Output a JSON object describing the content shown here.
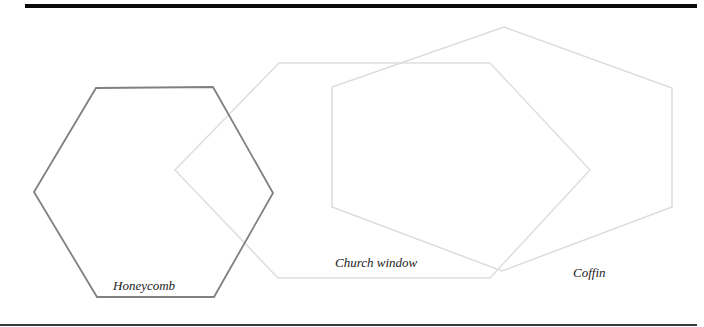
{
  "figure": {
    "rules": {
      "top": {
        "x1": 25,
        "x2": 697,
        "y": 6,
        "width": 4,
        "color": "#0a0a0a"
      },
      "bottom": {
        "x1": 0,
        "x2": 697,
        "y": 325,
        "width": 2,
        "color": "#3a3a3a"
      }
    },
    "shapes": [
      {
        "id": "honeycomb",
        "label": "Honeycomb",
        "stroke": "#808080",
        "stroke_width": 1.8,
        "points": "96,88 213,87 273,193 214,297 97,297 34,192",
        "label_pos": {
          "x": 113,
          "y": 279
        }
      },
      {
        "id": "church-window",
        "label": "Church window",
        "stroke": "#dedede",
        "stroke_width": 1.5,
        "points": "175,170 279,63 490,63 590,170 490,278 278,278",
        "label_pos": {
          "x": 335,
          "y": 256
        }
      },
      {
        "id": "coffin",
        "label": "Coffin",
        "stroke": "#dcdcdc",
        "stroke_width": 1.5,
        "points": "504,27 672,88 672,207 502,271 332,207 332,87",
        "label_pos": {
          "x": 573,
          "y": 266
        }
      }
    ]
  }
}
